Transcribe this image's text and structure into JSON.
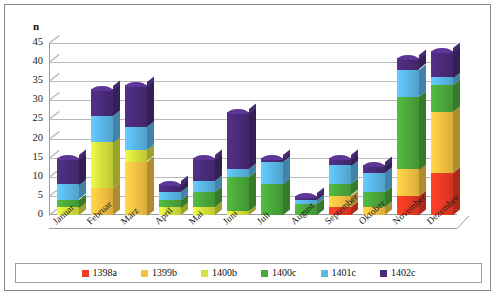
{
  "chart_data": {
    "type": "bar",
    "subtype": "stacked-column-3d",
    "title": "",
    "xlabel": "",
    "ylabel": "n",
    "ylim": [
      0,
      45
    ],
    "ytick_step": 5,
    "yticks": [
      0,
      5,
      10,
      15,
      20,
      25,
      30,
      35,
      40,
      45
    ],
    "grid": true,
    "legend_position": "bottom",
    "categories": [
      "Januar",
      "Februar",
      "März",
      "April",
      "Mai",
      "Juni",
      "Juli",
      "August",
      "September",
      "Oktober",
      "November",
      "Dezember"
    ],
    "series": [
      {
        "name": "1398a",
        "color": "#EE3B24",
        "values": [
          0,
          0,
          0,
          0,
          0,
          0,
          0,
          0,
          2,
          0,
          5,
          11
        ]
      },
      {
        "name": "1399b",
        "color": "#F5C342",
        "values": [
          0,
          7,
          14,
          0,
          0,
          0,
          0,
          0,
          3,
          2,
          7,
          16
        ]
      },
      {
        "name": "1400b",
        "color": "#D7E23C",
        "values": [
          2,
          12,
          3,
          2,
          2,
          1,
          0,
          0,
          0,
          0,
          0,
          0
        ]
      },
      {
        "name": "1400c",
        "color": "#4BA93B",
        "values": [
          2,
          0,
          0,
          2,
          4,
          9,
          8,
          3,
          3,
          4,
          19,
          7
        ]
      },
      {
        "name": "1401c",
        "color": "#5AB8E8",
        "values": [
          4,
          7,
          6,
          2,
          3,
          2,
          6,
          1,
          5,
          5,
          7,
          2
        ]
      },
      {
        "name": "1402c",
        "color": "#4A2B79",
        "values": [
          7,
          7,
          11,
          2,
          6,
          15,
          1,
          1,
          2,
          2,
          3,
          7
        ]
      }
    ],
    "totals": [
      15,
      33,
      34,
      8,
      15,
      27,
      15,
      5,
      15,
      13,
      41,
      43
    ]
  },
  "legend": {
    "items": [
      {
        "label": "1398a",
        "color": "#EE3B24"
      },
      {
        "label": "1399b",
        "color": "#F5C342"
      },
      {
        "label": "1400b",
        "color": "#D7E23C"
      },
      {
        "label": "1400c",
        "color": "#4BA93B"
      },
      {
        "label": "1401c",
        "color": "#5AB8E8"
      },
      {
        "label": "1402c",
        "color": "#4A2B79"
      }
    ]
  }
}
